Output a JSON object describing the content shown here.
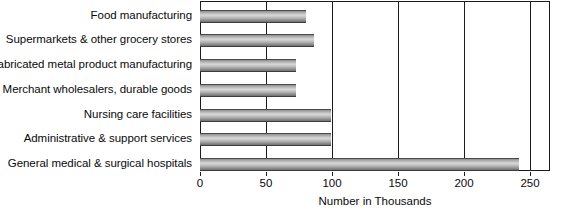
{
  "chart_data": {
    "type": "bar",
    "orientation": "horizontal",
    "title": "",
    "subtitle": "",
    "xlabel": "Number in Thousands",
    "ylabel": "",
    "categories": [
      "Food manufacturing",
      "Supermarkets & other grocery stores",
      "Fabricated metal product manufacturing",
      "Merchant wholesalers, durable goods",
      "Nursing care facilities",
      "Administrative & support services",
      "General medical & surgical hospitals"
    ],
    "values": [
      80,
      86,
      73,
      73,
      99,
      99,
      242
    ],
    "xlim": [
      0,
      265
    ],
    "xticks": [
      0,
      50,
      100,
      150,
      200,
      250
    ],
    "xtick_labels": [
      "0",
      "50",
      "100",
      "150",
      "200",
      "250"
    ],
    "grid": true,
    "grid_axis": "x",
    "legend": false,
    "bar_color": "#b0b0b0",
    "bar_edge_color": "#3d3d3d",
    "axis_color": "#1c1c1c",
    "background_color": "#ffffff"
  }
}
